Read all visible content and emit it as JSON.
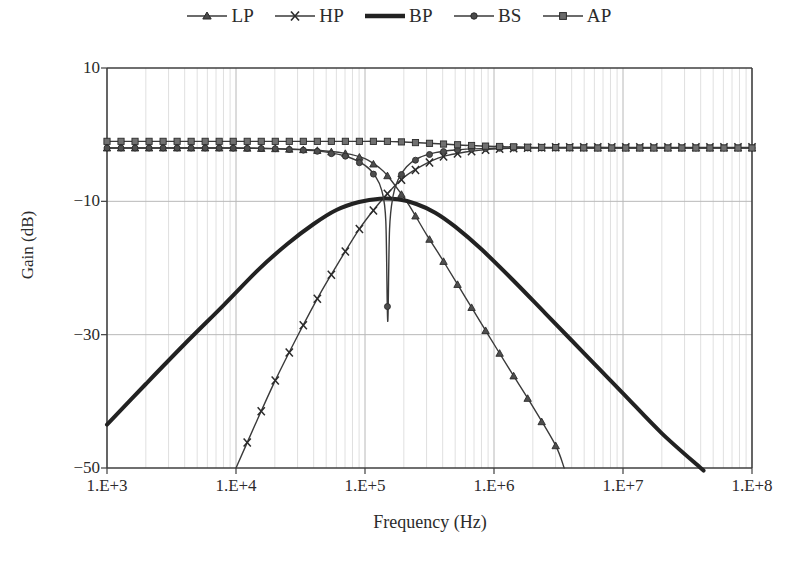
{
  "chart_data": {
    "type": "line",
    "title": "",
    "xlabel": "Frequency (Hz)",
    "ylabel": "Gain (dB)",
    "xscale": "log",
    "xlim": [
      1000,
      100000000
    ],
    "ylim": [
      -50,
      10
    ],
    "yticks": [
      10,
      -10,
      -30,
      -50
    ],
    "xticks": [
      "1.E+3",
      "1.E+4",
      "1.E+5",
      "1.E+6",
      "1.E+7",
      "1.E+8"
    ],
    "xtick_values": [
      1000,
      10000,
      100000,
      1000000,
      10000000,
      100000000
    ],
    "grid": true,
    "grid_minor_x": true,
    "legend_position": "top-center",
    "center_frequency_hz": 150000,
    "series": [
      {
        "name": "LP",
        "marker": "triangle",
        "line_width": 1.4,
        "color": "#3a3a3a",
        "x": [
          1000,
          2000,
          4000,
          7000,
          10000,
          20000,
          40000,
          70000,
          100000,
          130000,
          150000,
          180000,
          220000,
          300000,
          400000,
          600000,
          900000,
          1400000,
          2000000,
          3000000
        ],
        "y": [
          -2.0,
          -2.0,
          -2.0,
          -2.0,
          -2.0,
          -2.1,
          -2.3,
          -2.8,
          -3.6,
          -5.0,
          -6.2,
          -8.2,
          -10.6,
          -15.0,
          -18.8,
          -24.4,
          -30.0,
          -36.0,
          -40.8,
          -46.6
        ],
        "end_x": 3500000,
        "end_y": -50.0
      },
      {
        "name": "HP",
        "marker": "x",
        "line_width": 1.4,
        "color": "#3a3a3a",
        "x": [
          10000,
          14000,
          20000,
          30000,
          45000,
          65000,
          90000,
          120000,
          150000,
          200000,
          280000,
          400000,
          600000,
          900000,
          1500000,
          3000000,
          8000000,
          20000000,
          100000000
        ],
        "y": [
          -50.0,
          -43.6,
          -37.0,
          -30.2,
          -23.8,
          -18.6,
          -14.2,
          -11.0,
          -8.8,
          -6.4,
          -4.6,
          -3.3,
          -2.6,
          -2.2,
          -2.0,
          -1.9,
          -1.9,
          -1.9,
          -1.9
        ]
      },
      {
        "name": "BP",
        "marker": "none",
        "line_width": 4,
        "color": "#222222",
        "x": [
          1000,
          2000,
          4000,
          8000,
          15000,
          25000,
          40000,
          60000,
          90000,
          130000,
          180000,
          250000,
          350000,
          500000,
          800000,
          1400000,
          2500000,
          5000000,
          10000000,
          20000000,
          40000000
        ],
        "y": [
          -43.5,
          -37.4,
          -31.4,
          -25.6,
          -20.2,
          -16.4,
          -13.4,
          -11.3,
          -10.1,
          -9.6,
          -9.7,
          -10.4,
          -11.7,
          -13.8,
          -17.2,
          -21.8,
          -26.8,
          -32.8,
          -38.8,
          -44.8,
          -50.0
        ],
        "end_x": 40000000,
        "end_y": -50.0
      },
      {
        "name": "BS",
        "marker": "circle",
        "line_width": 1.4,
        "color": "#3a3a3a",
        "x": [
          1000,
          3000,
          8000,
          20000,
          40000,
          70000,
          100000,
          120000,
          135000,
          145000,
          150000,
          155000,
          165000,
          180000,
          210000,
          260000,
          350000,
          500000,
          800000,
          1500000,
          4000000,
          15000000,
          100000000
        ],
        "y": [
          -2.0,
          -2.0,
          -2.0,
          -2.1,
          -2.4,
          -3.2,
          -4.6,
          -6.2,
          -8.4,
          -13.0,
          -28.0,
          -14.2,
          -9.2,
          -6.8,
          -4.8,
          -3.5,
          -2.7,
          -2.3,
          -2.1,
          -2.0,
          -2.0,
          -2.0,
          -2.0
        ]
      },
      {
        "name": "AP",
        "marker": "square",
        "line_width": 1.4,
        "color": "#3a3a3a",
        "x": [
          1000,
          5000,
          20000,
          60000,
          100000,
          150000,
          200000,
          400000,
          800000,
          2000000,
          6000000,
          20000000,
          100000000
        ],
        "y": [
          -1.0,
          -1.0,
          -1.0,
          -1.0,
          -1.0,
          -1.0,
          -1.1,
          -1.4,
          -1.7,
          -1.9,
          -2.0,
          -2.0,
          -2.0
        ]
      }
    ]
  },
  "legend": {
    "items": [
      {
        "label": "LP",
        "marker": "triangle-marker"
      },
      {
        "label": "HP",
        "marker": "x-marker"
      },
      {
        "label": "BP",
        "marker": "thick-line-marker"
      },
      {
        "label": "BS",
        "marker": "circle-marker"
      },
      {
        "label": "AP",
        "marker": "square-marker"
      }
    ]
  },
  "axes": {
    "y_title": "Gain (dB)",
    "x_title": "Frequency (Hz)",
    "y_ticks": [
      "10",
      "−10",
      "−30",
      "−50"
    ],
    "x_ticks": [
      "1.E+3",
      "1.E+4",
      "1.E+5",
      "1.E+6",
      "1.E+7",
      "1.E+8"
    ]
  },
  "colors": {
    "frame": "#3f3f3f",
    "grid_major": "#b8b8b8",
    "grid_minor": "#d8d8d8",
    "series": "#3a3a3a",
    "bp": "#222222",
    "text": "#2b2b2b"
  }
}
